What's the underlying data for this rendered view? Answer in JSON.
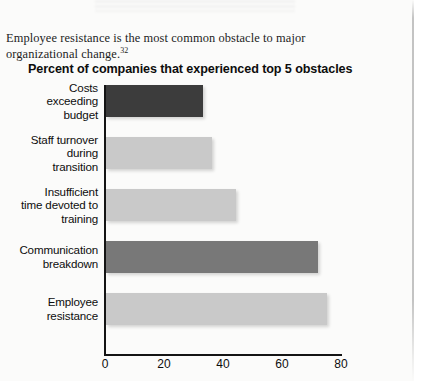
{
  "document": {
    "paragraph": "Employee resistance is the most common obstacle to major organizational change.",
    "footnote_marker": "32"
  },
  "chart_data": {
    "type": "bar",
    "orientation": "horizontal",
    "title": "Percent of companies that experienced top 5 obstacles",
    "xlabel": "",
    "ylabel": "",
    "xlim": [
      0,
      80
    ],
    "ticks": [
      "0",
      "20",
      "40",
      "60",
      "80"
    ],
    "tick_values": [
      0,
      20,
      40,
      60,
      80
    ],
    "grid": false,
    "legend": "none",
    "categories": [
      "Costs exceeding budget",
      "Staff turnover during transition",
      "Insufficient time devoted to training",
      "Communication breakdown",
      "Employee resistance"
    ],
    "category_lines": [
      [
        "Costs",
        "exceeding",
        "budget"
      ],
      [
        "Staff turnover",
        "during",
        "transition"
      ],
      [
        "Insufficient",
        "time devoted to",
        "training"
      ],
      [
        "Communication",
        "breakdown"
      ],
      [
        "Employee",
        "resistance"
      ]
    ],
    "values": [
      33,
      36,
      44,
      72,
      75
    ],
    "bar_colors": [
      "#3c3c3c",
      "#c9c9c9",
      "#c9c9c9",
      "#787878",
      "#c9c9c9"
    ]
  },
  "colors": {
    "page_background": "#fbfbfa",
    "text": "#0d0d0d",
    "axis": "#141414",
    "bar_dark": "#3c3c3c",
    "bar_medium": "#787878",
    "bar_light": "#c9c9c9"
  }
}
